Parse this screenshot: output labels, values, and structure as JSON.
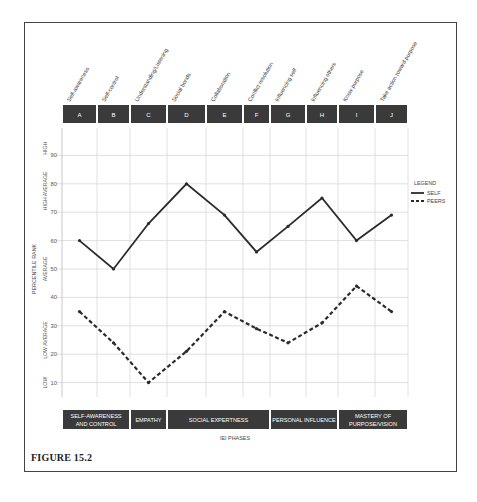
{
  "figure": {
    "caption": "FIGURE 15.2"
  },
  "chart_data": {
    "type": "line",
    "title": "",
    "xlabel": "IEI PHASES",
    "ylabel": "PERCENTILE RANK",
    "ylim": [
      5,
      100
    ],
    "grid": true,
    "legend_position": "right",
    "legend_title": "LEGEND",
    "categories": [
      "A",
      "B",
      "C",
      "D",
      "E",
      "F",
      "G",
      "H",
      "I",
      "J"
    ],
    "category_labels": [
      "Self-awareness",
      "Self-control",
      "Understanding/Listening",
      "Social bonds",
      "Collaboration",
      "Conflict resolution",
      "Influencing self",
      "Influencing others",
      "Know purpose",
      "Take action toward purpose"
    ],
    "yticks": [
      10,
      20,
      30,
      40,
      50,
      60,
      70,
      80,
      90
    ],
    "y_bands": [
      {
        "label": "HIGH",
        "range": [
          85,
          100
        ]
      },
      {
        "label": "HIGH AVERAGE",
        "range": [
          70,
          85
        ]
      },
      {
        "label": "AVERAGE",
        "range": [
          40,
          60
        ]
      },
      {
        "label": "LOW AVERAGE",
        "range": [
          15,
          35
        ]
      },
      {
        "label": "LOW",
        "range": [
          5,
          15
        ]
      }
    ],
    "phases": [
      {
        "label_line1": "SELF-AWARENESS",
        "label_line2": "AND CONTROL",
        "columns": [
          "A",
          "B"
        ]
      },
      {
        "label_line1": "EMPATHY",
        "label_line2": "",
        "columns": [
          "C"
        ]
      },
      {
        "label_line1": "SOCIAL EXPERTNESS",
        "label_line2": "",
        "columns": [
          "D",
          "E",
          "F"
        ]
      },
      {
        "label_line1": "PERSONAL INFLUENCE",
        "label_line2": "",
        "columns": [
          "G",
          "H"
        ]
      },
      {
        "label_line1": "MASTERY OF",
        "label_line2": "PURPOSE/VISION",
        "columns": [
          "I",
          "J"
        ]
      }
    ],
    "series": [
      {
        "name": "SELF",
        "style": "solid",
        "values": [
          60,
          50,
          66,
          80,
          69,
          56,
          65,
          75,
          60,
          69
        ]
      },
      {
        "name": "PEERS",
        "style": "dashed",
        "values": [
          35,
          24,
          10,
          21,
          35,
          29,
          24,
          31,
          44,
          35
        ]
      }
    ]
  },
  "colors": {
    "header_fill": "#3a3a3a",
    "line": "#2b2b2b",
    "grid": "#d8d8d8",
    "frame": "#444444"
  }
}
